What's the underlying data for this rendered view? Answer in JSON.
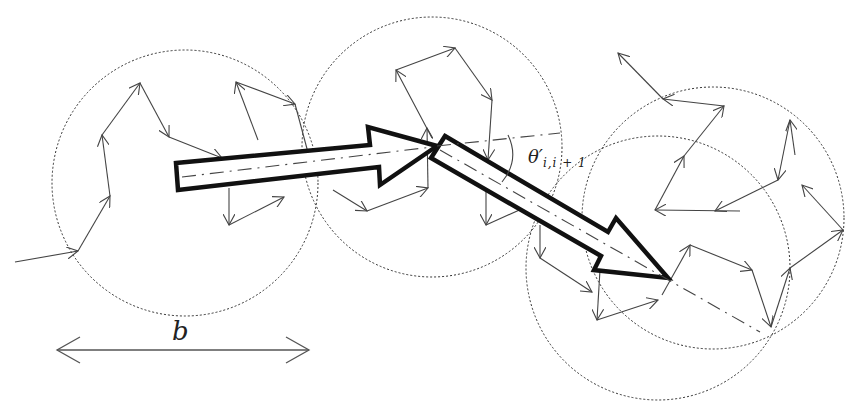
{
  "diagram": {
    "labels": {
      "blob_size": "b",
      "angle_symbol": "θ′",
      "angle_subscript": "i,i + 1"
    },
    "circles": [
      {
        "cx": 185,
        "cy": 183,
        "r": 133
      },
      {
        "cx": 432,
        "cy": 147,
        "r": 130
      },
      {
        "cx": 713,
        "cy": 218,
        "r": 131
      },
      {
        "cx": 658,
        "cy": 268,
        "r": 132
      }
    ],
    "random_walk_path": [
      [
        15,
        262
      ],
      [
        78,
        251
      ],
      [
        110,
        195
      ],
      [
        102,
        135
      ],
      [
        140,
        83
      ],
      [
        168,
        137
      ],
      [
        218,
        158
      ],
      [
        244,
        137
      ],
      [
        258,
        100
      ],
      [
        302,
        131
      ],
      [
        330,
        200
      ],
      [
        338,
        209
      ],
      [
        380,
        184
      ],
      [
        401,
        75
      ],
      [
        456,
        54
      ],
      [
        480,
        102
      ],
      [
        470,
        173
      ],
      [
        485,
        226
      ],
      [
        535,
        210
      ],
      [
        542,
        250
      ],
      [
        560,
        222
      ],
      [
        555,
        273
      ],
      [
        597,
        290
      ],
      [
        611,
        278
      ],
      [
        660,
        300
      ],
      [
        691,
        245
      ],
      [
        752,
        273
      ],
      [
        770,
        327
      ],
      [
        790,
        260
      ],
      [
        820,
        252
      ],
      [
        843,
        230
      ],
      [
        802,
        178
      ],
      [
        794,
        132
      ],
      [
        788,
        183
      ],
      [
        747,
        210
      ],
      [
        678,
        211
      ],
      [
        722,
        155
      ],
      [
        723,
        106
      ],
      [
        663,
        97
      ],
      [
        617,
        52
      ]
    ],
    "colors": {
      "line": "#444444",
      "arrow_stroke": "#111111",
      "background": "#ffffff"
    }
  }
}
